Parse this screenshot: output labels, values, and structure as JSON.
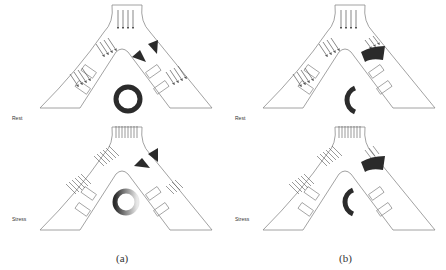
{
  "figure": {
    "subfigures": [
      {
        "caption": "(a)",
        "panels": [
          {
            "condition": "Rest",
            "ring": "full",
            "ring_shade": "solid"
          },
          {
            "condition": "Stress",
            "ring": "full",
            "ring_shade": "gradient"
          }
        ]
      },
      {
        "caption": "(b)",
        "panels": [
          {
            "condition": "Rest",
            "ring": "half",
            "ring_shade": "solid"
          },
          {
            "condition": "Stress",
            "ring": "half",
            "ring_shade": "solid"
          }
        ]
      }
    ],
    "colors": {
      "line": "#8a8a8a",
      "dark": "#2b2b2b",
      "background": "#ffffff"
    }
  }
}
